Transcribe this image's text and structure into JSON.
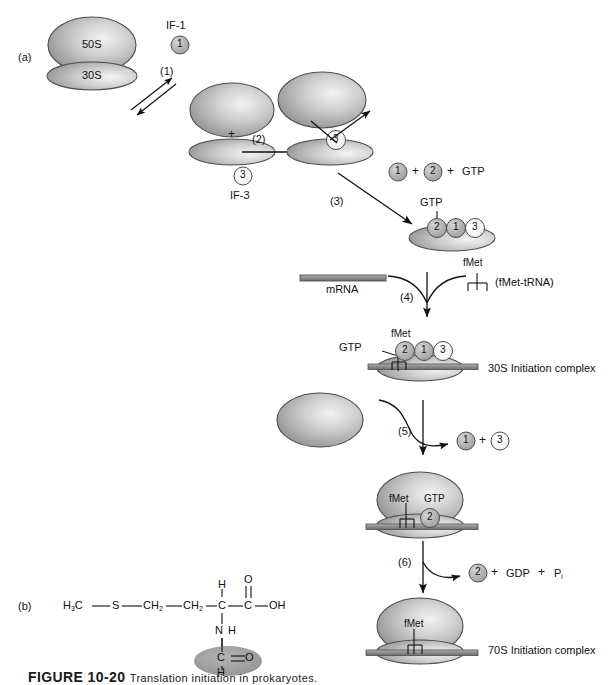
{
  "figure": {
    "panel_a_label": "(a)",
    "panel_b_label": "(b)",
    "caption_number": "FIGURE 10-20",
    "caption_text": "Translation initiation in prokaryotes."
  },
  "colors": {
    "subunit_fill": "#9a9a9a",
    "subunit_light": "#e8e8e8",
    "subunit_stroke": "#4d4d4d",
    "factor_gray": "#a8a8a8",
    "factor_white": "#fdfdfd",
    "mrna_fill": "#8e8e8e",
    "text": "#111111",
    "formyl_highlight": "#9e9e9e"
  },
  "panel_a": {
    "ribosome_70s": {
      "large_subunit_label": "50S",
      "small_subunit_label": "30S"
    },
    "factors": {
      "if1": {
        "symbol": "1",
        "name": "IF-1",
        "shade": "gray"
      },
      "if2": {
        "symbol": "2",
        "shade": "gray"
      },
      "if3": {
        "symbol": "3",
        "name": "IF-3",
        "shade": "white"
      }
    },
    "steps": [
      {
        "id": "1",
        "label": "(1)",
        "type": "equilibrium"
      },
      {
        "id": "2",
        "label": "(2)",
        "type": "arrow"
      },
      {
        "id": "3",
        "label": "(3)",
        "type": "arrow"
      },
      {
        "id": "4",
        "label": "(4)",
        "type": "arrow"
      },
      {
        "id": "5",
        "label": "(5)",
        "type": "arrow"
      },
      {
        "id": "6",
        "label": "(6)",
        "type": "arrow"
      }
    ],
    "plus_sign": "+",
    "reactants_step3": {
      "f1": "1",
      "plus_a": "+",
      "f2": "2",
      "plus_b": "+",
      "gtp": "GTP"
    },
    "gtp_label": "GTP",
    "fmet_label": "fMet",
    "mrna_label": "mRNA",
    "fmet_trna_label": "(fMet-tRNA)",
    "fmet_trna_top_label": "fMet",
    "complex_30s_label": "30S Initiation complex",
    "complex_70s_label": "70S Initiation complex",
    "released_step5": {
      "f1": "1",
      "plus": "+",
      "f3": "3"
    },
    "released_step6": {
      "f2": "2",
      "plus_a": "+",
      "gdp": "GDP",
      "plus_b": "+",
      "pi_main": "P",
      "pi_sub": "i"
    },
    "complex_mid_labels": {
      "fmet": "fMet",
      "gtp": "GTP",
      "factor": "2"
    },
    "complex_30s_factors": {
      "f2": "2",
      "f1": "1",
      "f3": "3"
    },
    "complex_30s_gtp": "GTP",
    "complex_30s_fmet": "fMet",
    "complex_70s_fmet": "fMet"
  },
  "panel_b": {
    "molecule_name": "N-formylmethionine",
    "atoms": {
      "h3c": {
        "main": "H",
        "sub": "3",
        "tail": "C"
      },
      "s": "S",
      "ch2_a": {
        "main": "CH",
        "sub": "2"
      },
      "ch2_b": {
        "main": "CH",
        "sub": "2"
      },
      "alpha_h": "H",
      "alpha_c": "C",
      "carboxyl_c": "C",
      "carboxyl_o": "O",
      "carboxyl_oh": "OH",
      "amide_n": "N",
      "amide_h": "H",
      "formyl_c": "C",
      "formyl_o": "O",
      "formyl_h": "H"
    },
    "bonds": {
      "single": "—",
      "double": "="
    }
  }
}
